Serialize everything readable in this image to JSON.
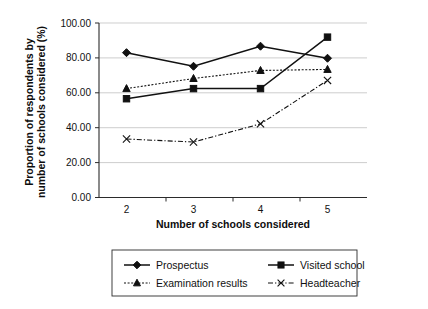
{
  "chart_data": {
    "type": "line",
    "title": "",
    "xlabel": "Number of schools considered",
    "ylabel": "Proportion of respondents by number of schools considered (%)",
    "ylabel_line1": "Proportion of respondents by",
    "ylabel_line2": "number of schools considered (%)",
    "categories": [
      "2",
      "3",
      "4",
      "5"
    ],
    "x": [
      2,
      3,
      4,
      5
    ],
    "ylim": [
      0,
      100
    ],
    "yticks": [
      0,
      20,
      40,
      60,
      80,
      100
    ],
    "ytick_labels": [
      "0.00",
      "20.00",
      "40.00",
      "60.00",
      "80.00",
      "100.00"
    ],
    "grid": "horizontal",
    "legend_position": "bottom",
    "series": [
      {
        "name": "Prospectus",
        "marker": "diamond",
        "line_style": "solid",
        "color": "#101010",
        "values": [
          83.0,
          75.2,
          86.7,
          79.8
        ]
      },
      {
        "name": "Visited school",
        "marker": "square",
        "line_style": "solid",
        "color": "#101010",
        "values": [
          56.6,
          62.4,
          62.4,
          91.9
        ]
      },
      {
        "name": "Examination results",
        "marker": "triangle",
        "line_style": "dotted",
        "color": "#101010",
        "values": [
          62.4,
          68.2,
          72.8,
          73.4
        ]
      },
      {
        "name": "Headteacher",
        "marker": "cross",
        "line_style": "dashdot",
        "color": "#101010",
        "values": [
          33.5,
          31.8,
          42.2,
          67.1
        ]
      }
    ]
  },
  "legend": {
    "items": [
      {
        "label": "Prospectus",
        "marker": "diamond",
        "line_style": "solid"
      },
      {
        "label": "Visited school",
        "marker": "square",
        "line_style": "solid"
      },
      {
        "label": "Examination results",
        "marker": "triangle",
        "line_style": "dotted"
      },
      {
        "label": "Headteacher",
        "marker": "cross",
        "line_style": "dashdot"
      }
    ]
  }
}
